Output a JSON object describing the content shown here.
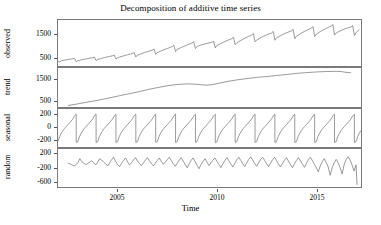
{
  "chart_data": {
    "type": "line",
    "title": "Decomposition of additive time series",
    "xlabel": "Time",
    "ylabel": "",
    "grid": false,
    "legend": "none",
    "xlim": [
      2002.0,
      2017.25
    ],
    "xticks": [
      2005,
      2010,
      2015
    ],
    "xtick_labels": [
      "2005",
      "2010",
      "2015"
    ],
    "panels": [
      {
        "name": "observed",
        "ylabel": "observed",
        "ylim": [
          120,
          2100
        ],
        "yticks": [
          500,
          1500
        ],
        "ytick_labels": [
          "500",
          "1500"
        ],
        "series": [
          {
            "name": "observed",
            "x": [
              2002.0,
              2002.083,
              2002.167,
              2002.25,
              2002.333,
              2002.417,
              2002.5,
              2002.583,
              2002.667,
              2002.75,
              2002.833,
              2002.917,
              2003.0,
              2003.083,
              2003.167,
              2003.25,
              2003.333,
              2003.417,
              2003.5,
              2003.583,
              2003.667,
              2003.75,
              2003.833,
              2003.917,
              2004.0,
              2004.083,
              2004.167,
              2004.25,
              2004.333,
              2004.417,
              2004.5,
              2004.583,
              2004.667,
              2004.75,
              2004.833,
              2004.917,
              2005.0,
              2005.083,
              2005.167,
              2005.25,
              2005.333,
              2005.417,
              2005.5,
              2005.583,
              2005.667,
              2005.75,
              2005.833,
              2005.917,
              2006.0,
              2006.083,
              2006.167,
              2006.25,
              2006.333,
              2006.417,
              2006.5,
              2006.583,
              2006.667,
              2006.75,
              2006.833,
              2006.917,
              2007.0,
              2007.083,
              2007.167,
              2007.25,
              2007.333,
              2007.417,
              2007.5,
              2007.583,
              2007.667,
              2007.75,
              2007.833,
              2007.917,
              2008.0,
              2008.083,
              2008.167,
              2008.25,
              2008.333,
              2008.417,
              2008.5,
              2008.583,
              2008.667,
              2008.75,
              2008.833,
              2008.917,
              2009.0,
              2009.083,
              2009.167,
              2009.25,
              2009.333,
              2009.417,
              2009.5,
              2009.583,
              2009.667,
              2009.75,
              2009.833,
              2009.917,
              2010.0,
              2010.083,
              2010.167,
              2010.25,
              2010.333,
              2010.417,
              2010.5,
              2010.583,
              2010.667,
              2010.75,
              2010.833,
              2010.917,
              2011.0,
              2011.083,
              2011.167,
              2011.25,
              2011.333,
              2011.417,
              2011.5,
              2011.583,
              2011.667,
              2011.75,
              2011.833,
              2011.917,
              2012.0,
              2012.083,
              2012.167,
              2012.25,
              2012.333,
              2012.417,
              2012.5,
              2012.583,
              2012.667,
              2012.75,
              2012.833,
              2012.917,
              2013.0,
              2013.083,
              2013.167,
              2013.25,
              2013.333,
              2013.417,
              2013.5,
              2013.583,
              2013.667,
              2013.75,
              2013.833,
              2013.917,
              2014.0,
              2014.083,
              2014.167,
              2014.25,
              2014.333,
              2014.417,
              2014.5,
              2014.583,
              2014.667,
              2014.75,
              2014.833,
              2014.917,
              2015.0,
              2015.083,
              2015.167,
              2015.25,
              2015.333,
              2015.417,
              2015.5,
              2015.583,
              2015.667,
              2015.75,
              2015.833,
              2015.917,
              2016.0,
              2016.083,
              2016.167,
              2016.25,
              2016.333,
              2016.417,
              2016.5,
              2016.583,
              2016.667,
              2016.75,
              2016.833,
              2016.917,
              2017.0,
              2017.083,
              2017.167
            ],
            "y": [
              330,
              300,
              345,
              360,
              370,
              390,
              395,
              410,
              420,
              430,
              445,
              300,
              355,
              360,
              380,
              400,
              415,
              425,
              440,
              455,
              465,
              480,
              500,
              350,
              410,
              420,
              440,
              465,
              480,
              500,
              515,
              530,
              545,
              560,
              590,
              420,
              480,
              500,
              520,
              545,
              565,
              585,
              605,
              625,
              640,
              660,
              700,
              510,
              590,
              610,
              640,
              665,
              690,
              715,
              735,
              760,
              780,
              800,
              850,
              620,
              700,
              730,
              760,
              790,
              820,
              850,
              875,
              900,
              930,
              955,
              1010,
              740,
              840,
              870,
              900,
              935,
              965,
              995,
              1025,
              1055,
              1080,
              1110,
              1170,
              870,
              960,
              985,
              1010,
              1035,
              1055,
              1075,
              1095,
              1110,
              1125,
              1140,
              1180,
              900,
              1010,
              1040,
              1075,
              1110,
              1145,
              1180,
              1210,
              1240,
              1270,
              1300,
              1360,
              1040,
              1120,
              1160,
              1200,
              1240,
              1280,
              1320,
              1355,
              1390,
              1420,
              1450,
              1520,
              1160,
              1240,
              1280,
              1320,
              1360,
              1395,
              1430,
              1460,
              1490,
              1515,
              1540,
              1610,
              1230,
              1330,
              1370,
              1410,
              1450,
              1485,
              1520,
              1550,
              1580,
              1605,
              1630,
              1700,
              1300,
              1400,
              1445,
              1490,
              1535,
              1575,
              1615,
              1650,
              1685,
              1715,
              1745,
              1820,
              1390,
              1490,
              1535,
              1580,
              1625,
              1665,
              1705,
              1740,
              1775,
              1805,
              1835,
              1910,
              1450,
              1540,
              1580,
              1615,
              1650,
              1680,
              1710,
              1735,
              1760,
              1780,
              1800,
              1860,
              1430,
              1560,
              1620,
              1680
            ]
          }
        ]
      },
      {
        "name": "trend",
        "ylabel": "trend",
        "ylim": [
          180,
          2050
        ],
        "yticks": [
          500,
          1500
        ],
        "ytick_labels": [
          "500",
          "1500"
        ],
        "series": [
          {
            "name": "trend",
            "x": [
              2002.5,
              2003.0,
              2003.5,
              2004.0,
              2004.5,
              2005.0,
              2005.5,
              2006.0,
              2006.5,
              2007.0,
              2007.5,
              2008.0,
              2008.5,
              2009.0,
              2009.25,
              2009.5,
              2009.75,
              2010.0,
              2010.5,
              2011.0,
              2011.5,
              2012.0,
              2012.5,
              2013.0,
              2013.5,
              2014.0,
              2014.5,
              2015.0,
              2015.5,
              2016.0,
              2016.25,
              2016.5,
              2016.75
            ],
            "y": [
              250,
              330,
              420,
              500,
              600,
              700,
              800,
              900,
              1010,
              1110,
              1200,
              1260,
              1290,
              1270,
              1240,
              1230,
              1250,
              1300,
              1400,
              1480,
              1540,
              1600,
              1640,
              1690,
              1740,
              1790,
              1830,
              1860,
              1880,
              1890,
              1880,
              1840,
              1820
            ]
          }
        ]
      },
      {
        "name": "seasonal",
        "ylabel": "seasonal",
        "ylim": [
          -320,
          300
        ],
        "yticks": [
          -200,
          0,
          200
        ],
        "ytick_labels": [
          "-200",
          "0",
          "200"
        ],
        "period": 1.0,
        "pattern": {
          "phase_x": [
            0.0,
            0.083,
            0.167,
            0.25,
            0.333,
            0.417,
            0.5,
            0.583,
            0.667,
            0.75,
            0.833,
            0.9166,
            0.9167,
            0.999
          ],
          "phase_y": [
            -230,
            -150,
            -95,
            -50,
            -15,
            15,
            45,
            75,
            105,
            140,
            190,
            215,
            -245,
            -235
          ]
        }
      },
      {
        "name": "random",
        "ylabel": "random",
        "ylim": [
          -760,
          340
        ],
        "yticks": [
          -600,
          -200,
          200
        ],
        "ytick_labels": [
          "-600",
          "-200",
          "200"
        ],
        "series": [
          {
            "name": "random",
            "x": [
              2002.5,
              2002.6,
              2002.7,
              2002.8,
              2002.9,
              2003.0,
              2003.1,
              2003.2,
              2003.3,
              2003.4,
              2003.5,
              2003.6,
              2003.7,
              2003.8,
              2003.9,
              2004.0,
              2004.1,
              2004.2,
              2004.3,
              2004.4,
              2004.5,
              2004.6,
              2004.7,
              2004.8,
              2004.9,
              2005.0,
              2005.1,
              2005.2,
              2005.3,
              2005.4,
              2005.5,
              2005.6,
              2005.7,
              2005.8,
              2005.9,
              2006.0,
              2006.1,
              2006.2,
              2006.3,
              2006.4,
              2006.5,
              2006.6,
              2006.7,
              2006.8,
              2006.9,
              2007.0,
              2007.1,
              2007.2,
              2007.3,
              2007.4,
              2007.5,
              2007.6,
              2007.7,
              2007.8,
              2007.9,
              2008.0,
              2008.1,
              2008.2,
              2008.3,
              2008.4,
              2008.5,
              2008.6,
              2008.7,
              2008.8,
              2008.9,
              2009.0,
              2009.1,
              2009.2,
              2009.3,
              2009.4,
              2009.5,
              2009.6,
              2009.7,
              2009.8,
              2009.9,
              2010.0,
              2010.1,
              2010.2,
              2010.3,
              2010.4,
              2010.5,
              2010.6,
              2010.7,
              2010.8,
              2010.9,
              2011.0,
              2011.1,
              2011.2,
              2011.3,
              2011.4,
              2011.5,
              2011.6,
              2011.7,
              2011.8,
              2011.9,
              2012.0,
              2012.1,
              2012.2,
              2012.3,
              2012.4,
              2012.5,
              2012.6,
              2012.7,
              2012.8,
              2012.9,
              2013.0,
              2013.1,
              2013.2,
              2013.3,
              2013.4,
              2013.5,
              2013.6,
              2013.7,
              2013.8,
              2013.9,
              2014.0,
              2014.1,
              2014.2,
              2014.3,
              2014.4,
              2014.5,
              2014.6,
              2014.7,
              2014.8,
              2014.9,
              2015.0,
              2015.1,
              2015.2,
              2015.3,
              2015.4,
              2015.5,
              2015.6,
              2015.7,
              2015.8,
              2015.9,
              2016.0,
              2016.1,
              2016.2,
              2016.3,
              2016.4,
              2016.5,
              2016.6,
              2016.7,
              2016.8,
              2016.9,
              2017.0,
              2017.05
            ],
            "y": [
              -60,
              -90,
              -120,
              -150,
              -120,
              -60,
              60,
              -30,
              -70,
              -110,
              -80,
              -40,
              0,
              -60,
              -120,
              -40,
              60,
              20,
              -40,
              -90,
              -150,
              -60,
              30,
              100,
              -20,
              -110,
              -170,
              -80,
              10,
              80,
              -30,
              -120,
              -60,
              20,
              90,
              -10,
              -80,
              -140,
              -60,
              20,
              90,
              0,
              -80,
              -150,
              -70,
              10,
              80,
              -20,
              -100,
              -40,
              30,
              100,
              10,
              -90,
              -160,
              -70,
              20,
              90,
              -10,
              -110,
              -200,
              -90,
              10,
              80,
              -30,
              -130,
              -230,
              -110,
              -20,
              60,
              -40,
              -140,
              -60,
              20,
              80,
              -20,
              -110,
              -200,
              -90,
              10,
              90,
              0,
              -100,
              -180,
              -70,
              30,
              100,
              10,
              -90,
              -170,
              -60,
              40,
              110,
              20,
              -80,
              -160,
              -60,
              40,
              100,
              10,
              -90,
              -170,
              -70,
              30,
              100,
              0,
              -100,
              -180,
              -80,
              20,
              90,
              -10,
              -110,
              -200,
              -90,
              10,
              90,
              0,
              -100,
              -190,
              -80,
              30,
              100,
              10,
              -100,
              -200,
              -320,
              -150,
              -30,
              60,
              -50,
              -180,
              -420,
              -200,
              -60,
              40,
              -60,
              -200,
              -380,
              -120,
              40,
              120,
              20,
              -120,
              -300,
              -120,
              -700
            ]
          }
        ]
      }
    ]
  },
  "axis_titles": {
    "x": "Time",
    "observed": "observed",
    "trend": "trend",
    "seasonal": "seasonal",
    "random": "random"
  },
  "colors": {
    "line": "#6e6e6e",
    "frame": "#7a7a7a",
    "text": "#000000",
    "background": "#ffffff"
  }
}
